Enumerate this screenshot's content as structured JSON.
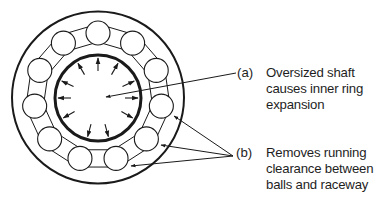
{
  "diagram": {
    "callouts": [
      {
        "tag": "(a)",
        "lines": [
          "Oversized shaft",
          "causes inner ring",
          "expansion"
        ]
      },
      {
        "tag": "(b)",
        "lines": [
          "Removes running",
          "clearance between",
          "balls and raceway"
        ]
      }
    ],
    "colors": {
      "stroke": "#1a1a1a",
      "background": "#ffffff"
    },
    "geometry": {
      "center": [
        98,
        97
      ],
      "outer_ring_radius": 86,
      "inner_ring_radius": 43,
      "ball_count": 11,
      "ball_radius": 12,
      "ball_pitch_radius": 64,
      "expansion_arrow_count": 11
    }
  }
}
